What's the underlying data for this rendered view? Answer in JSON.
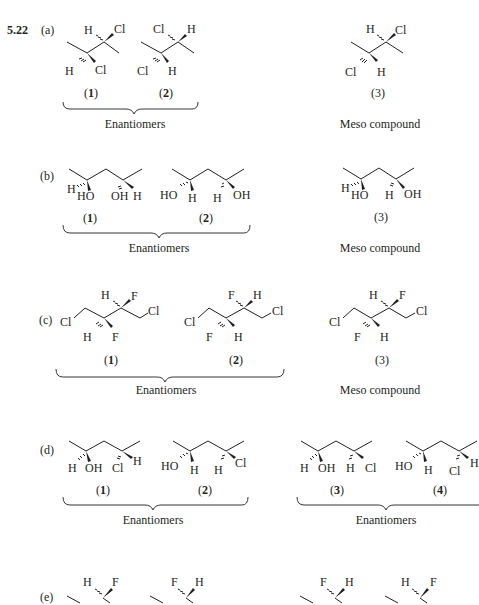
{
  "problem": {
    "number": "5.22"
  },
  "parts": [
    {
      "label": "(a)",
      "compounds": [
        {
          "id": "(1)",
          "num": "1",
          "atoms": [
            "H",
            "Cl",
            "H",
            "Cl"
          ]
        },
        {
          "id": "(2)",
          "num": "2",
          "atoms": [
            "Cl",
            "H",
            "Cl",
            "H"
          ]
        },
        {
          "id": "(3)",
          "num": "3",
          "atoms": [
            "H",
            "Cl",
            "Cl",
            "H"
          ]
        }
      ],
      "groups": [
        {
          "caption": "Enantiomers",
          "members": [
            "1",
            "2"
          ]
        },
        {
          "caption": "Meso compound",
          "members": [
            "3"
          ]
        }
      ]
    },
    {
      "label": "(b)",
      "compounds": [
        {
          "id": "(1)",
          "num": "1",
          "atoms": [
            "H",
            "HO",
            "OH",
            "H"
          ]
        },
        {
          "id": "(2)",
          "num": "2",
          "atoms": [
            "HO",
            "H",
            "H",
            "OH"
          ]
        },
        {
          "id": "(3)",
          "num": "3",
          "atoms": [
            "H",
            "HO",
            "H",
            "OH"
          ]
        }
      ],
      "groups": [
        {
          "caption": "Enantiomers",
          "members": [
            "1",
            "2"
          ]
        },
        {
          "caption": "Meso compound",
          "members": [
            "3"
          ]
        }
      ]
    },
    {
      "label": "(c)",
      "compounds": [
        {
          "id": "(1)",
          "num": "1",
          "atoms": [
            "Cl",
            "H",
            "F",
            "H",
            "F",
            "Cl"
          ]
        },
        {
          "id": "(2)",
          "num": "2",
          "atoms": [
            "Cl",
            "F",
            "H",
            "F",
            "H",
            "Cl"
          ]
        },
        {
          "id": "(3)",
          "num": "3",
          "atoms": [
            "Cl",
            "H",
            "F",
            "F",
            "H",
            "Cl"
          ]
        }
      ],
      "groups": [
        {
          "caption": "Enantiomers",
          "members": [
            "1",
            "2"
          ]
        },
        {
          "caption": "Meso compound",
          "members": [
            "3"
          ]
        }
      ]
    },
    {
      "label": "(d)",
      "compounds": [
        {
          "id": "(1)",
          "num": "1",
          "atoms": [
            "H",
            "OH",
            "Cl",
            "H"
          ]
        },
        {
          "id": "(2)",
          "num": "2",
          "atoms": [
            "HO",
            "H",
            "H",
            "Cl"
          ]
        },
        {
          "id": "(3)",
          "num": "3",
          "atoms": [
            "H",
            "OH",
            "H",
            "Cl"
          ]
        },
        {
          "id": "(4)",
          "num": "4",
          "atoms": [
            "HO",
            "H",
            "Cl",
            "H"
          ]
        }
      ],
      "groups": [
        {
          "caption": "Enantiomers",
          "members": [
            "1",
            "2"
          ]
        },
        {
          "caption": "Enantiomers",
          "members": [
            "3",
            "4"
          ]
        }
      ]
    },
    {
      "label": "(e)",
      "compounds": [
        {
          "atoms": [
            "H",
            "F"
          ]
        },
        {
          "atoms": [
            "F",
            "H"
          ]
        },
        {
          "atoms": [
            "F",
            "H"
          ]
        },
        {
          "atoms": [
            "H",
            "F"
          ]
        }
      ]
    }
  ]
}
